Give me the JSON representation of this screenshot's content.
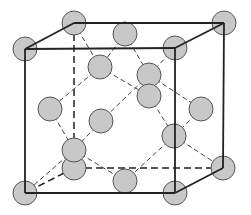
{
  "diagram": {
    "type": "crystal-lattice",
    "structure": "diamond-cubic",
    "colors": {
      "atom_fill": "#c8c8c8",
      "atom_stroke": "#555555",
      "edge": "#222222",
      "bond": "#444444",
      "background": "#ffffff"
    },
    "atom_radius": 12,
    "cube_front": [
      [
        25,
        49
      ],
      [
        175,
        48
      ],
      [
        175,
        193
      ],
      [
        25,
        193
      ]
    ],
    "cube_back": [
      [
        74,
        23
      ],
      [
        224,
        23
      ],
      [
        223,
        168
      ],
      [
        74,
        168
      ]
    ],
    "cube_solid_edges": [
      [
        [
          25,
          49
        ],
        [
          175,
          48
        ]
      ],
      [
        [
          175,
          48
        ],
        [
          175,
          193
        ]
      ],
      [
        [
          175,
          193
        ],
        [
          25,
          193
        ]
      ],
      [
        [
          25,
          193
        ],
        [
          25,
          49
        ]
      ],
      [
        [
          74,
          23
        ],
        [
          224,
          23
        ]
      ],
      [
        [
          224,
          23
        ],
        [
          223,
          168
        ]
      ],
      [
        [
          25,
          49
        ],
        [
          74,
          23
        ]
      ],
      [
        [
          175,
          48
        ],
        [
          224,
          23
        ]
      ],
      [
        [
          175,
          193
        ],
        [
          223,
          168
        ]
      ]
    ],
    "cube_hidden_edges": [
      [
        [
          74,
          23
        ],
        [
          74,
          168
        ]
      ],
      [
        [
          74,
          168
        ],
        [
          223,
          168
        ]
      ],
      [
        [
          74,
          168
        ],
        [
          25,
          193
        ]
      ]
    ],
    "bonds": [
      [
        [
          74,
          23
        ],
        [
          100,
          67
        ]
      ],
      [
        [
          125,
          34
        ],
        [
          100,
          67
        ]
      ],
      [
        [
          125,
          34
        ],
        [
          149,
          75
        ]
      ],
      [
        [
          175,
          48
        ],
        [
          149,
          75
        ]
      ],
      [
        [
          100,
          67
        ],
        [
          50,
          109
        ]
      ],
      [
        [
          100,
          67
        ],
        [
          149,
          96
        ]
      ],
      [
        [
          149,
          75
        ],
        [
          101,
          121
        ]
      ],
      [
        [
          101,
          121
        ],
        [
          74,
          150
        ]
      ],
      [
        [
          149,
          75
        ],
        [
          201,
          109
        ]
      ],
      [
        [
          149,
          96
        ],
        [
          174,
          136
        ]
      ],
      [
        [
          201,
          109
        ],
        [
          174,
          136
        ]
      ],
      [
        [
          174,
          136
        ],
        [
          125,
          181
        ]
      ],
      [
        [
          174,
          136
        ],
        [
          223,
          168
        ]
      ],
      [
        [
          50,
          109
        ],
        [
          74,
          150
        ]
      ],
      [
        [
          74,
          150
        ],
        [
          25,
          193
        ]
      ],
      [
        [
          74,
          150
        ],
        [
          125,
          181
        ]
      ]
    ],
    "atoms": [
      {
        "name": "corner-back-top-left",
        "x": 74,
        "y": 23
      },
      {
        "name": "corner-back-top-right",
        "x": 224,
        "y": 23
      },
      {
        "name": "corner-back-bottom-left",
        "x": 74,
        "y": 168
      },
      {
        "name": "corner-back-bottom-right",
        "x": 223,
        "y": 168
      },
      {
        "name": "face-top",
        "x": 125,
        "y": 34
      },
      {
        "name": "inner-1",
        "x": 100,
        "y": 67
      },
      {
        "name": "inner-2",
        "x": 149,
        "y": 75
      },
      {
        "name": "face-front",
        "x": 149,
        "y": 96
      },
      {
        "name": "face-left",
        "x": 50,
        "y": 109
      },
      {
        "name": "face-back",
        "x": 101,
        "y": 121
      },
      {
        "name": "face-right",
        "x": 201,
        "y": 109
      },
      {
        "name": "inner-3",
        "x": 174,
        "y": 136
      },
      {
        "name": "inner-4",
        "x": 74,
        "y": 150
      },
      {
        "name": "face-bottom",
        "x": 125,
        "y": 181
      },
      {
        "name": "corner-front-top-left",
        "x": 25,
        "y": 49
      },
      {
        "name": "corner-front-top-right",
        "x": 175,
        "y": 48
      },
      {
        "name": "corner-front-bottom-left",
        "x": 25,
        "y": 193
      },
      {
        "name": "corner-front-bottom-right",
        "x": 175,
        "y": 193
      }
    ]
  }
}
